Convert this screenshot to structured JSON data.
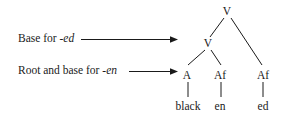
{
  "figure": {
    "type": "syntax-tree",
    "background_color": "#ffffff",
    "ink_color": "#1a1a1a"
  },
  "annotations": [
    {
      "id": "base-for-ed",
      "text_plain": "Base for ",
      "text_italic": "-ed",
      "arrow": "long-rightwards-arrow",
      "points_to": "node-v-inner"
    },
    {
      "id": "root-and-base-for-en",
      "text_plain": "Root and base for ",
      "text_italic": "-en",
      "arrow": "long-rightwards-arrow",
      "points_to": "node-a"
    }
  ],
  "tree": {
    "nodes": [
      {
        "id": "v-root",
        "label": "V",
        "level": 0
      },
      {
        "id": "v-inner",
        "label": "V",
        "level": 1
      },
      {
        "id": "a",
        "label": "A",
        "level": 2
      },
      {
        "id": "af-en",
        "label": "Af",
        "level": 2
      },
      {
        "id": "af-ed",
        "label": "Af",
        "level": 2
      }
    ],
    "terminals": [
      {
        "id": "black",
        "label": "black",
        "parent": "a"
      },
      {
        "id": "en",
        "label": "en",
        "parent": "af-en"
      },
      {
        "id": "ed",
        "label": "ed",
        "parent": "af-ed"
      }
    ],
    "edges": [
      {
        "from": "v-root",
        "to": "v-inner"
      },
      {
        "from": "v-root",
        "to": "af-ed"
      },
      {
        "from": "v-inner",
        "to": "a"
      },
      {
        "from": "v-inner",
        "to": "af-en"
      },
      {
        "from": "a",
        "to": "black"
      },
      {
        "from": "af-en",
        "to": "en"
      },
      {
        "from": "af-ed",
        "to": "ed"
      }
    ]
  }
}
